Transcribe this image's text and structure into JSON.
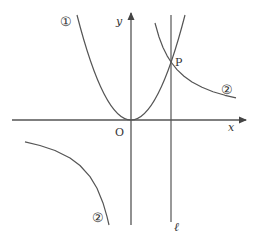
{
  "diagram": {
    "type": "coordinate-graph",
    "colors": {
      "stroke": "#555555",
      "text": "#333333",
      "background": "#ffffff"
    },
    "axes": {
      "x_label": "x",
      "y_label": "y",
      "origin_label": "O"
    },
    "curves": [
      {
        "id": "parabola",
        "label": "①",
        "kind": "parabola with vertex at origin"
      },
      {
        "id": "hyperbola",
        "label": "②",
        "kind": "hyperbola (two branches, quadrants I and III)"
      }
    ],
    "hyperbola_branch_labels": {
      "right": "②",
      "left": "②"
    },
    "line": {
      "label": "ℓ",
      "kind": "vertical line through P"
    },
    "point": {
      "label": "P",
      "description": "intersection of ① and ② on line ℓ"
    }
  }
}
